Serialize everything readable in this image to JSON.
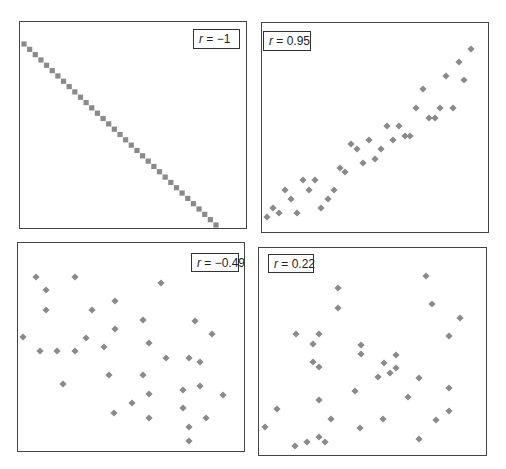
{
  "chart_data": [
    {
      "type": "scatter",
      "title": "",
      "annotation": "r = −1",
      "r_label": {
        "var": "r",
        "value": "−1"
      },
      "xlabel": "",
      "ylabel": "",
      "grid": false,
      "marker": "square",
      "color": "#8a8a8a",
      "frame": {
        "x": 19,
        "y": 21,
        "w": 228,
        "h": 208
      },
      "label_box": {
        "x": 193,
        "y": 29,
        "w": 47,
        "h": 20
      },
      "points": "linear",
      "n": 35,
      "start": [
        24,
        44
      ],
      "end": [
        216,
        225
      ]
    },
    {
      "type": "scatter",
      "title": "",
      "annotation": "r = 0.95",
      "r_label": {
        "var": "r",
        "value": "0.95"
      },
      "xlabel": "",
      "ylabel": "",
      "grid": false,
      "marker": "diamond",
      "color": "#8a8a8a",
      "frame": {
        "x": 261,
        "y": 22,
        "w": 228,
        "h": 211
      },
      "label_box": {
        "x": 263,
        "y": 31,
        "w": 48,
        "h": 20
      },
      "points": [
        [
          267,
          217
        ],
        [
          273,
          208
        ],
        [
          279,
          213
        ],
        [
          285,
          190
        ],
        [
          291,
          199
        ],
        [
          297,
          213
        ],
        [
          303,
          180
        ],
        [
          309,
          190
        ],
        [
          315,
          180
        ],
        [
          321,
          208
        ],
        [
          328,
          199
        ],
        [
          334,
          190
        ],
        [
          340,
          168
        ],
        [
          345,
          172
        ],
        [
          351,
          144
        ],
        [
          357,
          149
        ],
        [
          363,
          163
        ],
        [
          369,
          140
        ],
        [
          375,
          159
        ],
        [
          381,
          149
        ],
        [
          387,
          126
        ],
        [
          393,
          140
        ],
        [
          399,
          126
        ],
        [
          405,
          136
        ],
        [
          410,
          136
        ],
        [
          416,
          108
        ],
        [
          423,
          89
        ],
        [
          429,
          118
        ],
        [
          435,
          118
        ],
        [
          440,
          108
        ],
        [
          446,
          76
        ],
        [
          453,
          108
        ],
        [
          459,
          62
        ],
        [
          464,
          80
        ],
        [
          471,
          49
        ]
      ]
    },
    {
      "type": "scatter",
      "title": "",
      "annotation": "r = −0.49",
      "r_label": {
        "var": "r",
        "value": "−0.49"
      },
      "xlabel": "",
      "ylabel": "",
      "grid": false,
      "marker": "diamond",
      "color": "#8a8a8a",
      "frame": {
        "x": 17,
        "y": 242,
        "w": 228,
        "h": 210
      },
      "label_box": {
        "x": 191,
        "y": 253,
        "w": 48,
        "h": 19
      },
      "points": [
        [
          23,
          337
        ],
        [
          36,
          277
        ],
        [
          46,
          290
        ],
        [
          46,
          310
        ],
        [
          40,
          351
        ],
        [
          57,
          351
        ],
        [
          63,
          384
        ],
        [
          75,
          277
        ],
        [
          75,
          351
        ],
        [
          86,
          338
        ],
        [
          92,
          310
        ],
        [
          104,
          347
        ],
        [
          109,
          375
        ],
        [
          115,
          301
        ],
        [
          115,
          329
        ],
        [
          114,
          413
        ],
        [
          132,
          403
        ],
        [
          143,
          320
        ],
        [
          143,
          375
        ],
        [
          149,
          343
        ],
        [
          149,
          394
        ],
        [
          149,
          418
        ],
        [
          161,
          283
        ],
        [
          166,
          358
        ],
        [
          183,
          390
        ],
        [
          183,
          408
        ],
        [
          189,
          358
        ],
        [
          189,
          427
        ],
        [
          189,
          441
        ],
        [
          195,
          321
        ],
        [
          200,
          362
        ],
        [
          200,
          386
        ],
        [
          206,
          418
        ],
        [
          212,
          334
        ],
        [
          223,
          395
        ]
      ]
    },
    {
      "type": "scatter",
      "title": "",
      "annotation": "r = 0.22",
      "r_label": {
        "var": "r",
        "value": "0.22"
      },
      "xlabel": "",
      "ylabel": "",
      "grid": false,
      "marker": "diamond",
      "color": "#8a8a8a",
      "frame": {
        "x": 258,
        "y": 247,
        "w": 229,
        "h": 209
      },
      "label_box": {
        "x": 268,
        "y": 254,
        "w": 46,
        "h": 19
      },
      "points": [
        [
          265,
          427
        ],
        [
          277,
          409
        ],
        [
          295,
          446
        ],
        [
          296,
          334
        ],
        [
          307,
          442
        ],
        [
          313,
          344
        ],
        [
          313,
          362
        ],
        [
          319,
          334
        ],
        [
          319,
          367
        ],
        [
          319,
          400
        ],
        [
          319,
          437
        ],
        [
          325,
          442
        ],
        [
          331,
          419
        ],
        [
          338,
          288
        ],
        [
          338,
          308
        ],
        [
          355,
          391
        ],
        [
          360,
          428
        ],
        [
          361,
          345
        ],
        [
          361,
          354
        ],
        [
          378,
          377
        ],
        [
          384,
          363
        ],
        [
          383,
          419
        ],
        [
          390,
          373
        ],
        [
          396,
          355
        ],
        [
          396,
          368
        ],
        [
          408,
          397
        ],
        [
          419,
          378
        ],
        [
          419,
          439
        ],
        [
          426,
          276
        ],
        [
          432,
          304
        ],
        [
          436,
          420
        ],
        [
          449,
          336
        ],
        [
          449,
          388
        ],
        [
          449,
          411
        ],
        [
          460,
          318
        ]
      ]
    }
  ]
}
